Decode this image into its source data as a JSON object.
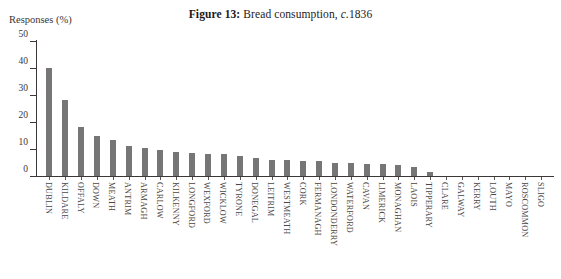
{
  "figure": {
    "number_label": "Figure 13:",
    "caption_prefix": "Bread consumption, ",
    "caption_italic": "c.",
    "caption_suffix": "1836",
    "full_title": "Figure 13: Bread consumption, c.1836"
  },
  "axes": {
    "y_title": "Responses (%)",
    "y_ticks": [
      "0",
      "10",
      "20",
      "30",
      "40",
      "50"
    ]
  },
  "colors": {
    "bar": "#767676",
    "axis": "#3c3838",
    "text": "#231f1f",
    "background": "#ffffff"
  },
  "chart_data": {
    "type": "bar",
    "xlabel": "",
    "ylabel": "Responses (%)",
    "ylim": [
      0,
      50
    ],
    "yticks": [
      0,
      10,
      20,
      30,
      40,
      50
    ],
    "grid": false,
    "legend": false,
    "orientation": "vertical",
    "categories": [
      "DUBLIN",
      "KILDARE",
      "OFFALY",
      "DOWN",
      "MEATH",
      "ANTRIM",
      "ARMAGH",
      "CARLOW",
      "KILKENNY",
      "LONGFORD",
      "WEXFORD",
      "WICKLOW",
      "TYRONE",
      "DONEGAL",
      "LEITRIM",
      "WESTMEATH",
      "CORK",
      "FERMANAGH",
      "LONDONDERRY",
      "WATERFORD",
      "CAVAN",
      "LIMERICK",
      "MONAGHAN",
      "LAOIS",
      "TIPPERARY",
      "CLARE",
      "GALWAY",
      "KERRY",
      "LOUTH",
      "MAYO",
      "ROSCOMMON",
      "SLIGO"
    ],
    "values": [
      40,
      28,
      18,
      15,
      13.5,
      11,
      10.5,
      9.5,
      9,
      8.5,
      8,
      8,
      7.5,
      6.5,
      6,
      6,
      5.5,
      5.5,
      5,
      5,
      4.5,
      4.5,
      4,
      3.5,
      1.5,
      0,
      0,
      0,
      0,
      0,
      0,
      0
    ]
  }
}
